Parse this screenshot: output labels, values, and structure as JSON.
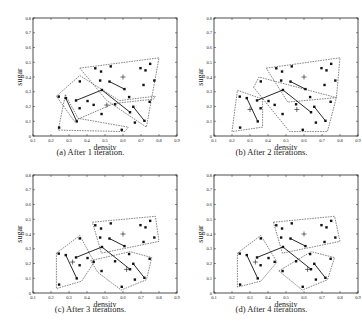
{
  "chart_data": [
    {
      "type": "scatter",
      "title": "After 1 iteration.",
      "caption": "(a) After 1 iteration.",
      "xlabel": "density",
      "ylabel": "sugar",
      "xlim": [
        0.1,
        0.9
      ],
      "ylim": [
        0,
        0.8
      ],
      "xticks": [
        "0.1",
        "0.2",
        "0.3",
        "0.4",
        "0.5",
        "0.6",
        "0.7",
        "0.8",
        "0.9"
      ],
      "yticks": [
        "0",
        "0.1",
        "0.2",
        "0.3",
        "0.4",
        "0.5",
        "0.6",
        "0.7",
        "0.8"
      ],
      "centroids": [
        [
          0.6,
          0.4
        ],
        [
          0.51,
          0.21
        ]
      ],
      "regions": [
        [
          [
            0.36,
            0.46
          ],
          [
            0.8,
            0.53
          ],
          [
            0.73,
            0.06
          ],
          [
            0.51,
            0.24
          ]
        ],
        [
          [
            0.23,
            0.27
          ],
          [
            0.36,
            0.41
          ],
          [
            0.58,
            0.24
          ],
          [
            0.78,
            0.27
          ],
          [
            0.77,
            0.25
          ],
          [
            0.55,
            0.22
          ],
          [
            0.36,
            0.12
          ],
          [
            0.33,
            0.1
          ]
        ],
        [
          [
            0.28,
            0.28
          ],
          [
            0.35,
            0.12
          ],
          [
            0.63,
            0.06
          ],
          [
            0.61,
            0.03
          ],
          [
            0.24,
            0.04
          ]
        ]
      ]
    },
    {
      "type": "scatter",
      "title": "After 2 iterations.",
      "caption": "(b) After 2 iterations.",
      "xlabel": "density",
      "ylabel": "sugar",
      "xlim": [
        0.1,
        0.9
      ],
      "ylim": [
        0,
        0.8
      ],
      "xticks": [
        "0.1",
        "0.2",
        "0.3",
        "0.4",
        "0.5",
        "0.6",
        "0.7",
        "0.8",
        "0.9"
      ],
      "yticks": [
        "0",
        "0.1",
        "0.2",
        "0.3",
        "0.4",
        "0.5",
        "0.6",
        "0.7",
        "0.8"
      ],
      "centroids": [
        [
          0.6,
          0.4
        ],
        [
          0.56,
          0.18
        ],
        [
          0.3,
          0.18
        ]
      ],
      "regions": [
        [
          [
            0.39,
            0.46
          ],
          [
            0.8,
            0.53
          ],
          [
            0.78,
            0.26
          ],
          [
            0.51,
            0.23
          ]
        ],
        [
          [
            0.32,
            0.33
          ],
          [
            0.35,
            0.4
          ],
          [
            0.78,
            0.26
          ],
          [
            0.73,
            0.03
          ],
          [
            0.52,
            0.03
          ]
        ],
        [
          [
            0.2,
            0.03
          ],
          [
            0.23,
            0.31
          ],
          [
            0.37,
            0.25
          ],
          [
            0.37,
            0.06
          ]
        ]
      ]
    },
    {
      "type": "scatter",
      "title": "After 3 iterations.",
      "caption": "(c) After 3 iterations.",
      "xlabel": "density",
      "ylabel": "sugar",
      "xlim": [
        0.1,
        0.9
      ],
      "ylim": [
        0,
        0.8
      ],
      "xticks": [
        "0.1",
        "0.2",
        "0.3",
        "0.4",
        "0.5",
        "0.6",
        "0.7",
        "0.8",
        "0.9"
      ],
      "yticks": [
        "0",
        "0.1",
        "0.2",
        "0.3",
        "0.4",
        "0.5",
        "0.6",
        "0.7",
        "0.8"
      ],
      "centroids": [
        [
          0.6,
          0.4
        ],
        [
          0.62,
          0.16
        ],
        [
          0.32,
          0.21
        ]
      ],
      "regions": [
        [
          [
            0.43,
            0.48
          ],
          [
            0.78,
            0.52
          ],
          [
            0.8,
            0.35
          ],
          [
            0.48,
            0.27
          ]
        ],
        [
          [
            0.42,
            0.22
          ],
          [
            0.64,
            0.28
          ],
          [
            0.76,
            0.24
          ],
          [
            0.73,
            0.09
          ],
          [
            0.59,
            0.02
          ],
          [
            0.46,
            0.14
          ]
        ],
        [
          [
            0.23,
            0.27
          ],
          [
            0.36,
            0.39
          ],
          [
            0.44,
            0.21
          ],
          [
            0.37,
            0.08
          ],
          [
            0.23,
            0.03
          ]
        ]
      ]
    },
    {
      "type": "scatter",
      "title": "After 4 iterations.",
      "caption": "(d) After 4 iterations.",
      "xlabel": "density",
      "ylabel": "sugar",
      "xlim": [
        0.1,
        0.9
      ],
      "ylim": [
        0,
        0.8
      ],
      "xticks": [
        "0.1",
        "0.2",
        "0.3",
        "0.4",
        "0.5",
        "0.6",
        "0.7",
        "0.8",
        "0.9"
      ],
      "yticks": [
        "0",
        "0.1",
        "0.2",
        "0.3",
        "0.4",
        "0.5",
        "0.6",
        "0.7",
        "0.8"
      ],
      "centroids": [
        [
          0.6,
          0.4
        ],
        [
          0.62,
          0.16
        ],
        [
          0.33,
          0.21
        ]
      ],
      "regions": [
        [
          [
            0.43,
            0.48
          ],
          [
            0.77,
            0.52
          ],
          [
            0.8,
            0.35
          ],
          [
            0.48,
            0.27
          ]
        ],
        [
          [
            0.46,
            0.15
          ],
          [
            0.64,
            0.28
          ],
          [
            0.77,
            0.24
          ],
          [
            0.73,
            0.09
          ],
          [
            0.59,
            0.02
          ]
        ],
        [
          [
            0.23,
            0.27
          ],
          [
            0.36,
            0.39
          ],
          [
            0.45,
            0.21
          ],
          [
            0.36,
            0.08
          ],
          [
            0.23,
            0.04
          ]
        ]
      ]
    }
  ],
  "points": [
    [
      0.697,
      0.46
    ],
    [
      0.774,
      0.376
    ],
    [
      0.634,
      0.264
    ],
    [
      0.608,
      0.318
    ],
    [
      0.556,
      0.215
    ],
    [
      0.403,
      0.237
    ],
    [
      0.481,
      0.149
    ],
    [
      0.437,
      0.211
    ],
    [
      0.666,
      0.091
    ],
    [
      0.243,
      0.267
    ],
    [
      0.245,
      0.057
    ],
    [
      0.343,
      0.099
    ],
    [
      0.639,
      0.161
    ],
    [
      0.657,
      0.198
    ],
    [
      0.36,
      0.37
    ],
    [
      0.593,
      0.042
    ],
    [
      0.719,
      0.103
    ],
    [
      0.359,
      0.188
    ],
    [
      0.339,
      0.241
    ],
    [
      0.282,
      0.257
    ],
    [
      0.748,
      0.232
    ],
    [
      0.714,
      0.346
    ],
    [
      0.483,
      0.312
    ],
    [
      0.478,
      0.437
    ],
    [
      0.525,
      0.369
    ],
    [
      0.751,
      0.489
    ],
    [
      0.532,
      0.472
    ],
    [
      0.473,
      0.376
    ],
    [
      0.725,
      0.445
    ],
    [
      0.446,
      0.459
    ]
  ],
  "segments": [
    [
      [
        0.525,
        0.369
      ],
      [
        0.608,
        0.318
      ]
    ],
    [
      [
        0.483,
        0.312
      ],
      [
        0.639,
        0.161
      ]
    ],
    [
      [
        0.657,
        0.198
      ],
      [
        0.719,
        0.103
      ]
    ],
    [
      [
        0.282,
        0.257
      ],
      [
        0.343,
        0.099
      ]
    ],
    [
      [
        0.339,
        0.241
      ],
      [
        0.483,
        0.312
      ]
    ]
  ]
}
